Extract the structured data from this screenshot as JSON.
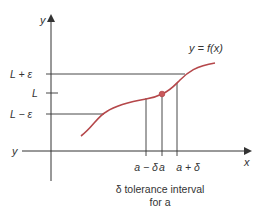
{
  "diagram": {
    "y_axis_label": "y",
    "x_axis_label": "x",
    "left_axis_label": "y",
    "function_label": "y = f(x)",
    "y_ticks": [
      "L + ε",
      "L",
      "L − ε"
    ],
    "x_ticks": [
      "a − δ",
      "a",
      "a + δ"
    ],
    "caption_line1": "δ tolerance interval",
    "caption_line2": "for a",
    "colors": {
      "curve": "#b5474a",
      "axis": "#333333"
    }
  }
}
